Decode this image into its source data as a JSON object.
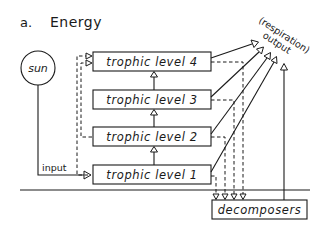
{
  "figure": {
    "panel_label": "a.",
    "title": "Energy"
  },
  "source": {
    "label": "sun",
    "input_label": "input"
  },
  "trophic_levels": [
    {
      "label": "trophic level 4"
    },
    {
      "label": "trophic level 3"
    },
    {
      "label": "trophic level 2"
    },
    {
      "label": "trophic level 1"
    }
  ],
  "output": {
    "line1": "(respiration)",
    "line2": "output"
  },
  "decomposers": {
    "label": "decomposers"
  },
  "colors": {
    "ink": "#1a1a1a",
    "background": "#ffffff"
  }
}
